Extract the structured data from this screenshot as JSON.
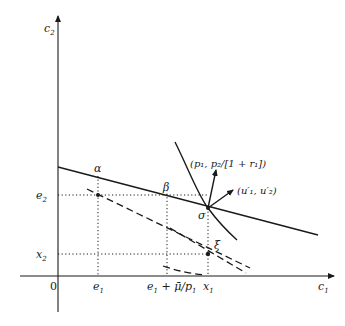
{
  "figure": {
    "axes": {
      "y_label": "c",
      "y_sub": "2",
      "x_label": "c",
      "x_sub": "1",
      "origin_label": "0"
    },
    "x_ticks": [
      {
        "main": "e",
        "sub": "1",
        "suffix": ""
      },
      {
        "main": "e",
        "sub": "1",
        "suffix": " + μ̄/p",
        "suffix_sub": "1"
      },
      {
        "main": "x",
        "sub": "1",
        "suffix": ""
      }
    ],
    "y_ticks": [
      {
        "main": "e",
        "sub": "2"
      },
      {
        "main": "x",
        "sub": "2"
      }
    ],
    "points": {
      "alpha": "α",
      "beta": "β",
      "sigma": "σ",
      "xi": "ξ"
    },
    "vectors": {
      "price_vector": "(p₁, p₂/[1 + r₁])",
      "utility_gradient": "(u′₁, u′₂)"
    }
  }
}
